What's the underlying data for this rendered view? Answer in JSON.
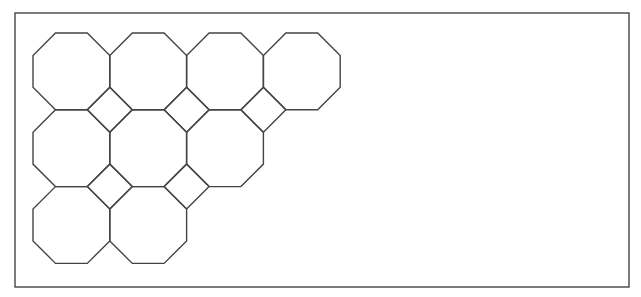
{
  "diagram": {
    "frame": {
      "x": 15,
      "y": 13,
      "width": 614,
      "height": 274
    },
    "stroke_color": "#444444",
    "stroke_width": 1.4,
    "background": "#ffffff",
    "tiling": {
      "origin_x": 33,
      "origin_y": 33,
      "octagon_width": 76.8,
      "rows": [
        {
          "row": 0,
          "octagon_count": 4
        },
        {
          "row": 1,
          "octagon_count": 3
        },
        {
          "row": 2,
          "octagon_count": 2
        }
      ],
      "squares": [
        {
          "between_rows": [
            0,
            1
          ],
          "at_column_boundary": 1
        },
        {
          "between_rows": [
            0,
            1
          ],
          "at_column_boundary": 2
        },
        {
          "between_rows": [
            0,
            1
          ],
          "at_column_boundary": 3
        },
        {
          "between_rows": [
            1,
            2
          ],
          "at_column_boundary": 1
        },
        {
          "between_rows": [
            1,
            2
          ],
          "at_column_boundary": 2
        }
      ],
      "total_octagons": 9,
      "total_squares": 5
    }
  }
}
